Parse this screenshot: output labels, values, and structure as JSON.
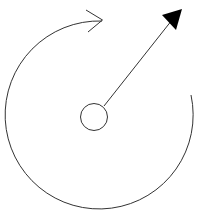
{
  "diagram": {
    "title": "Rotation diagram",
    "colors": {
      "background": "#ffffff",
      "stroke": "#333333",
      "arrowhead_fill": "#000000"
    },
    "elements": {
      "center_circle": {
        "cx": 94,
        "cy": 117,
        "r": 13.5,
        "label": "pivot"
      },
      "vector_arrow": {
        "x1": 104,
        "y1": 106,
        "x2": 178,
        "y2": 13,
        "head": "filled-triangle",
        "label": "direction vector"
      },
      "rotation_arc": {
        "cx": 99,
        "cy": 116,
        "r": 94,
        "start": [
          191,
          95
        ],
        "end": [
          102,
          21
        ],
        "direction": "counterclockwise",
        "head": "open-chevron",
        "label": "rotation arc"
      }
    }
  }
}
